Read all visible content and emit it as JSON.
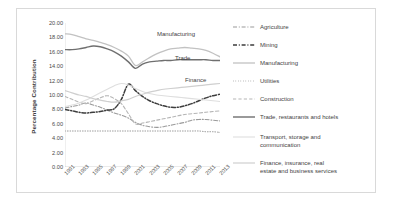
{
  "chart_data": {
    "type": "line",
    "title": "",
    "xlabel": "",
    "ylabel": "Percentage Contribution",
    "ylim": [
      0,
      20
    ],
    "ytick_labels": [
      "20.00",
      "18.00",
      "16.00",
      "14.00",
      "12.00",
      "10.00",
      "8.00",
      "6.00",
      "4.00",
      "2.00",
      "0.00"
    ],
    "ytick_values": [
      20,
      18,
      16,
      14,
      12,
      10,
      8,
      6,
      4,
      2,
      0
    ],
    "grid": false,
    "legend_position": "right",
    "x": [
      1991,
      1992,
      1993,
      1994,
      1995,
      1996,
      1997,
      1998,
      1999,
      2000,
      2001,
      2002,
      2003,
      2004,
      2005,
      2006,
      2007,
      2008,
      2009,
      2010,
      2011,
      2012,
      2013
    ],
    "xtick_labels": [
      "1991",
      "1993",
      "1995",
      "1997",
      "1999",
      "2001",
      "2003",
      "2005",
      "2007",
      "2009",
      "2011",
      "2013"
    ],
    "annotations": [
      {
        "text": "Manufacturing",
        "x": 140,
        "y": 22
      },
      {
        "text": "Trade",
        "x": 158,
        "y": 46
      },
      {
        "text": "Finance",
        "x": 168,
        "y": 68
      }
    ],
    "series": [
      {
        "name": "Agriculture",
        "style": "dash-dot",
        "color": "#9a9a9a",
        "width": 1.1,
        "values": [
          8.2,
          8.4,
          8.6,
          8.9,
          8.6,
          8.3,
          7.9,
          7.5,
          7.2,
          6.8,
          6.2,
          5.8,
          5.6,
          5.5,
          5.6,
          5.8,
          6.0,
          6.2,
          6.5,
          6.6,
          6.6,
          6.5,
          6.4
        ]
      },
      {
        "name": "Mining",
        "style": "dash-dot",
        "color": "#3d3d3d",
        "width": 1.5,
        "values": [
          8.0,
          7.8,
          7.6,
          7.5,
          7.6,
          7.7,
          7.9,
          8.1,
          9.4,
          11.5,
          10.6,
          9.8,
          9.2,
          8.8,
          8.5,
          8.3,
          8.3,
          8.5,
          8.8,
          9.2,
          9.6,
          9.9,
          10.1
        ]
      },
      {
        "name": "Manufacturing",
        "style": "solid",
        "color": "#c2c2c2",
        "width": 1.3,
        "values": [
          18.5,
          18.4,
          18.1,
          17.8,
          17.6,
          17.3,
          17.0,
          16.6,
          16.1,
          15.4,
          14.1,
          14.6,
          15.2,
          15.7,
          16.1,
          16.4,
          16.5,
          16.6,
          16.5,
          16.4,
          16.2,
          15.8,
          15.3
        ]
      },
      {
        "name": "Utilities",
        "style": "dotted",
        "color": "#8f8f8f",
        "width": 1.0,
        "values": [
          5.0,
          5.0,
          5.0,
          5.0,
          5.0,
          5.0,
          5.0,
          5.0,
          5.0,
          5.0,
          5.0,
          5.0,
          5.0,
          5.0,
          5.0,
          5.0,
          5.0,
          5.0,
          5.0,
          5.0,
          4.9,
          4.9,
          4.8
        ]
      },
      {
        "name": "Construction",
        "style": "dashed",
        "color": "#b5b5b5",
        "width": 1.1,
        "values": [
          9.8,
          9.4,
          9.0,
          8.8,
          9.2,
          9.6,
          9.9,
          9.5,
          8.8,
          7.4,
          6.0,
          6.1,
          6.3,
          6.5,
          6.7,
          6.9,
          7.1,
          7.3,
          7.4,
          7.5,
          7.6,
          7.7,
          7.8
        ]
      },
      {
        "name": "Trade, restaurants and hotels",
        "style": "solid",
        "color": "#6f6f6f",
        "width": 1.4,
        "values": [
          16.3,
          16.3,
          16.4,
          16.6,
          16.8,
          16.7,
          16.4,
          16.0,
          15.4,
          14.6,
          13.7,
          14.3,
          14.6,
          14.7,
          14.8,
          14.8,
          14.9,
          14.9,
          14.9,
          14.9,
          14.9,
          14.8,
          14.8
        ]
      },
      {
        "name": "Transport, storage and communication",
        "style": "solid",
        "color": "#dedede",
        "width": 1.1,
        "values": [
          8.4,
          8.6,
          8.9,
          9.3,
          9.8,
          10.3,
          10.8,
          11.3,
          11.6,
          11.4,
          10.9,
          10.5,
          10.2,
          10.0,
          9.9,
          9.8,
          9.7,
          9.6,
          9.5,
          9.4,
          9.3,
          9.2,
          9.1
        ]
      },
      {
        "name": "Finance, insurance, real estate and business services",
        "style": "solid",
        "color": "#cfcfcf",
        "width": 1.2,
        "values": [
          10.6,
          10.3,
          10.0,
          9.8,
          9.5,
          9.3,
          9.1,
          9.0,
          9.2,
          9.4,
          9.8,
          10.1,
          10.4,
          10.6,
          10.8,
          10.9,
          11.0,
          11.1,
          11.2,
          11.3,
          11.4,
          11.5,
          11.6
        ]
      }
    ]
  },
  "legend": {
    "items": [
      {
        "label": "Agriculture"
      },
      {
        "label": "Mining"
      },
      {
        "label": "Manufacturing"
      },
      {
        "label": "Utilities"
      },
      {
        "label": "Construction"
      },
      {
        "label": "Trade, restaurants and hotels"
      },
      {
        "label": "Transport, storage and\ncommunication"
      },
      {
        "label": "Finance, insurance, real\nestate and business services"
      }
    ]
  }
}
